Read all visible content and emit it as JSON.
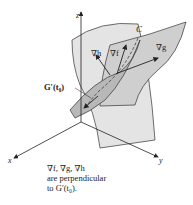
{
  "figure": {
    "axes": {
      "x": "x",
      "y": "y",
      "z": "z"
    },
    "labels": {
      "curve": "C",
      "grad_h": "∇h",
      "grad_f": "∇f",
      "grad_g": "∇g",
      "tangent": "G′(t₀)"
    },
    "caption": {
      "line1": "∇f, ∇g, ∇h",
      "line2": "are perpendicular",
      "line3": "to G′(t₀)."
    },
    "colors": {
      "surface_light": "#e4e4e4",
      "surface_mid": "#cfcfcf",
      "surface_dark": "#b8b8b8",
      "stroke": "#333333"
    }
  }
}
